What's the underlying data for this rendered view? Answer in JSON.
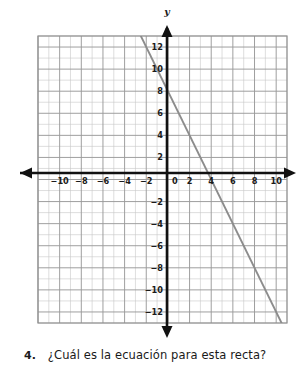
{
  "question": {
    "number": "4.",
    "text": "¿Cuál es la ecuación para esta recta?"
  },
  "axis_names": {
    "y": "y"
  },
  "colors": {
    "line": "#8c8c8c",
    "axis": "#111111",
    "major_grid": "#9a9a9a",
    "minor_grid": "#c8c8c8",
    "text": "#1a1a1a",
    "background": "#ffffff"
  },
  "chart_data": {
    "type": "line",
    "title": "",
    "xlabel": "",
    "ylabel": "y",
    "xlim": [
      -12,
      11
    ],
    "ylim": [
      -13,
      13
    ],
    "grid": true,
    "minor_grid_step": 1,
    "major_grid_step": 2,
    "legend": "none",
    "xticks": [
      -10,
      -8,
      -6,
      -4,
      -2,
      0,
      2,
      4,
      6,
      8,
      10
    ],
    "xtick_labels": [
      "-10",
      "-8",
      "-6",
      "-4",
      "-2",
      "0",
      "2",
      "4",
      "6",
      "8",
      "10"
    ],
    "yticks": [
      12,
      10,
      8,
      6,
      4,
      2,
      -2,
      -4,
      -6,
      -8,
      -10,
      -12
    ],
    "ytick_labels": [
      "12",
      "10",
      "8",
      "6",
      "4",
      "2",
      "-2",
      "-4",
      "-6",
      "-8",
      "-10",
      "-12"
    ],
    "series": [
      {
        "name": "recta",
        "equation": "y = -2x + 8",
        "slope": -2,
        "intercept": 8,
        "x_intercept": 4,
        "points": [
          [
            -2.5,
            13
          ],
          [
            0,
            8
          ],
          [
            4,
            0
          ],
          [
            10.5,
            -13
          ]
        ]
      }
    ]
  }
}
